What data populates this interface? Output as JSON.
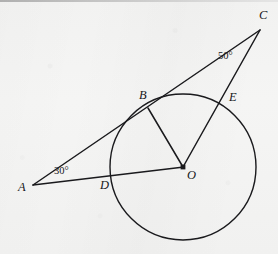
{
  "figure": {
    "kind": "geometry-diagram",
    "canvas": {
      "width": 278,
      "height": 254
    },
    "colors": {
      "background": "#f3f3f2",
      "ink": "#1a1a1d",
      "scan_edge": "#8d8d8d"
    },
    "circle": {
      "name": "main-circle",
      "center": {
        "x": 183,
        "y": 167
      },
      "radius": 73,
      "stroke_width": 1.4
    },
    "points": [
      {
        "id": "A",
        "label": "A",
        "x": 33,
        "y": 185,
        "label_x": 18,
        "label_y": 181,
        "dot": false
      },
      {
        "id": "B",
        "label": "B",
        "x": 148,
        "y": 108,
        "label_x": 139,
        "label_y": 89,
        "dot": false
      },
      {
        "id": "C",
        "label": "C",
        "x": 260,
        "y": 30,
        "label_x": 259,
        "label_y": 9,
        "dot": false
      },
      {
        "id": "D",
        "label": "D",
        "x": 111,
        "y": 177,
        "label_x": 100,
        "label_y": 179,
        "dot": false
      },
      {
        "id": "E",
        "label": "E",
        "x": 221,
        "y": 105,
        "label_x": 229,
        "label_y": 91,
        "dot": false
      },
      {
        "id": "O",
        "label": "O",
        "x": 183,
        "y": 167,
        "label_x": 187,
        "label_y": 169,
        "dot": true
      }
    ],
    "segments": [
      {
        "id": "AC",
        "name": "segment-a-to-c",
        "from": "A",
        "to": "C",
        "x1": 33,
        "y1": 185,
        "x2": 260,
        "y2": 30
      },
      {
        "id": "AO",
        "name": "segment-a-to-o",
        "from": "A",
        "to": "O",
        "x1": 33,
        "y1": 185,
        "x2": 184,
        "y2": 167
      },
      {
        "id": "BO",
        "name": "segment-b-to-o",
        "from": "B",
        "to": "O",
        "x1": 148,
        "y1": 108,
        "x2": 183,
        "y2": 167
      },
      {
        "id": "OC",
        "name": "segment-o-to-c",
        "from": "O",
        "to": "C",
        "x1": 183,
        "y1": 167,
        "x2": 260,
        "y2": 30
      }
    ],
    "angles": [
      {
        "id": "angle-A",
        "name": "angle-label-30",
        "value": "30°",
        "at_vertex": "A",
        "label_x": 54,
        "label_y": 166
      },
      {
        "id": "angle-C",
        "name": "angle-label-50",
        "value": "50°",
        "at_vertex": "C",
        "label_x": 218,
        "label_y": 51
      }
    ]
  }
}
